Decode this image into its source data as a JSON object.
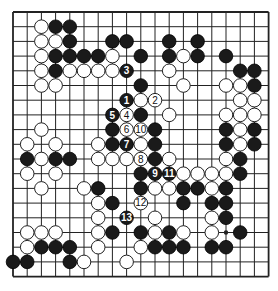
{
  "diagram": {
    "type": "go-board",
    "size": 19,
    "geometry": {
      "x0": 13,
      "y0": 12,
      "dx": 14.2,
      "dy": 14.7,
      "stone_radius": 6.8
    },
    "colors": {
      "black": "#1a1a1a",
      "white": "#ffffff",
      "line": "#222222",
      "background": "#ffffff"
    },
    "star_points": [
      [
        3,
        3
      ],
      [
        9,
        3
      ],
      [
        15,
        3
      ],
      [
        3,
        9
      ],
      [
        9,
        9
      ],
      [
        15,
        9
      ],
      [
        3,
        15
      ],
      [
        9,
        15
      ],
      [
        15,
        15
      ]
    ],
    "black_stones": [
      [
        3,
        1
      ],
      [
        4,
        1
      ],
      [
        4,
        2
      ],
      [
        7,
        2
      ],
      [
        8,
        2
      ],
      [
        11,
        2
      ],
      [
        13,
        2
      ],
      [
        3,
        3
      ],
      [
        4,
        3
      ],
      [
        5,
        3
      ],
      [
        6,
        3
      ],
      [
        9,
        3
      ],
      [
        11,
        3
      ],
      [
        13,
        3
      ],
      [
        15,
        3
      ],
      [
        3,
        4
      ],
      [
        16,
        4
      ],
      [
        17,
        4
      ],
      [
        9,
        5
      ],
      [
        17,
        5
      ],
      [
        9,
        7
      ],
      [
        7,
        8
      ],
      [
        10,
        8
      ],
      [
        15,
        8
      ],
      [
        17,
        8
      ],
      [
        7,
        9
      ],
      [
        10,
        9
      ],
      [
        15,
        9
      ],
      [
        17,
        9
      ],
      [
        1,
        10
      ],
      [
        3,
        10
      ],
      [
        4,
        10
      ],
      [
        10,
        10
      ],
      [
        16,
        10
      ],
      [
        9,
        11
      ],
      [
        16,
        11
      ],
      [
        6,
        12
      ],
      [
        9,
        12
      ],
      [
        12,
        12
      ],
      [
        13,
        12
      ],
      [
        15,
        12
      ],
      [
        7,
        13
      ],
      [
        12,
        13
      ],
      [
        14,
        13
      ],
      [
        15,
        13
      ],
      [
        15,
        14
      ],
      [
        7,
        15
      ],
      [
        9,
        15
      ],
      [
        11,
        15
      ],
      [
        16,
        15
      ],
      [
        2,
        16
      ],
      [
        3,
        16
      ],
      [
        4,
        16
      ],
      [
        10,
        16
      ],
      [
        11,
        16
      ],
      [
        12,
        16
      ],
      [
        14,
        16
      ],
      [
        15,
        16
      ],
      [
        0,
        17
      ],
      [
        1,
        17
      ],
      [
        4,
        17
      ]
    ],
    "white_stones": [
      [
        2,
        1
      ],
      [
        2,
        2
      ],
      [
        3,
        2
      ],
      [
        2,
        3
      ],
      [
        7,
        3
      ],
      [
        12,
        3
      ],
      [
        2,
        4
      ],
      [
        4,
        4
      ],
      [
        5,
        4
      ],
      [
        6,
        4
      ],
      [
        7,
        4
      ],
      [
        11,
        4
      ],
      [
        2,
        5
      ],
      [
        3,
        5
      ],
      [
        12,
        5
      ],
      [
        15,
        5
      ],
      [
        16,
        5
      ],
      [
        9,
        6
      ],
      [
        16,
        6
      ],
      [
        17,
        6
      ],
      [
        11,
        7
      ],
      [
        15,
        7
      ],
      [
        16,
        7
      ],
      [
        17,
        7
      ],
      [
        2,
        8
      ],
      [
        16,
        8
      ],
      [
        1,
        9
      ],
      [
        3,
        9
      ],
      [
        6,
        9
      ],
      [
        9,
        9
      ],
      [
        16,
        9
      ],
      [
        2,
        10
      ],
      [
        6,
        10
      ],
      [
        7,
        10
      ],
      [
        8,
        10
      ],
      [
        11,
        10
      ],
      [
        15,
        10
      ],
      [
        1,
        11
      ],
      [
        3,
        11
      ],
      [
        12,
        11
      ],
      [
        13,
        11
      ],
      [
        14,
        11
      ],
      [
        15,
        11
      ],
      [
        2,
        12
      ],
      [
        5,
        12
      ],
      [
        10,
        12
      ],
      [
        11,
        12
      ],
      [
        14,
        12
      ],
      [
        6,
        13
      ],
      [
        6,
        14
      ],
      [
        10,
        14
      ],
      [
        14,
        14
      ],
      [
        1,
        15
      ],
      [
        2,
        15
      ],
      [
        3,
        15
      ],
      [
        6,
        15
      ],
      [
        10,
        15
      ],
      [
        12,
        15
      ],
      [
        14,
        15
      ],
      [
        1,
        16
      ],
      [
        6,
        16
      ],
      [
        9,
        16
      ],
      [
        5,
        17
      ],
      [
        8,
        17
      ]
    ],
    "numbered_moves": [
      {
        "n": "1",
        "color": "black",
        "col": 8,
        "row": 6
      },
      {
        "n": "2",
        "color": "white",
        "col": 10,
        "row": 6
      },
      {
        "n": "3",
        "color": "black",
        "col": 8,
        "row": 4
      },
      {
        "n": "4",
        "color": "white",
        "col": 8,
        "row": 7
      },
      {
        "n": "5",
        "color": "black",
        "col": 7,
        "row": 7
      },
      {
        "n": "6",
        "color": "white",
        "col": 8,
        "row": 8
      },
      {
        "n": "7",
        "color": "black",
        "col": 8,
        "row": 9
      },
      {
        "n": "8",
        "color": "white",
        "col": 9,
        "row": 10
      },
      {
        "n": "9",
        "color": "black",
        "col": 10,
        "row": 11
      },
      {
        "n": "10",
        "color": "white",
        "col": 9,
        "row": 8
      },
      {
        "n": "11",
        "color": "black",
        "col": 11,
        "row": 11
      },
      {
        "n": "12",
        "color": "white",
        "col": 9,
        "row": 13
      },
      {
        "n": "13",
        "color": "black",
        "col": 8,
        "row": 14
      }
    ]
  }
}
